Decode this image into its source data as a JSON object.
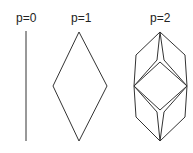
{
  "labels": {
    "p0": "p=0",
    "p1": "p=1",
    "p2": "p=2"
  },
  "colors": {
    "stroke": "#333333"
  }
}
